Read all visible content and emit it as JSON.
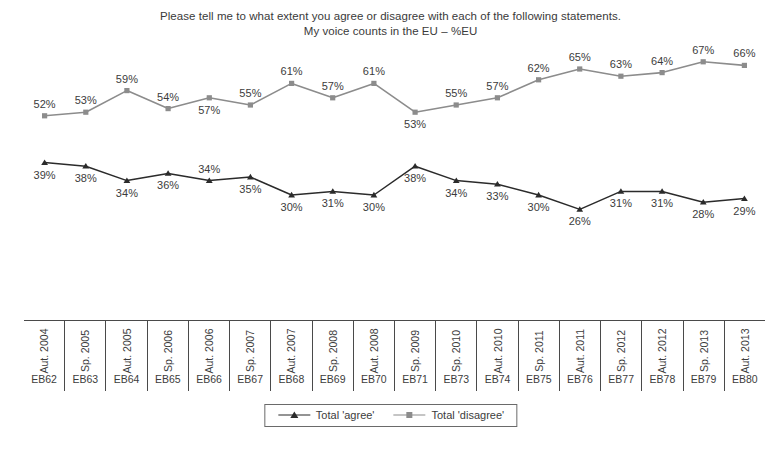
{
  "chart_data": {
    "type": "line",
    "title": "Please tell me to what extent you agree or disagree with each of the following statements.",
    "subtitle": "My voice counts in the EU – %EU",
    "xlabel": "",
    "ylabel": "",
    "ylim": [
      20,
      70
    ],
    "grid": false,
    "legend_position": "bottom-center",
    "categories": [
      "EB62",
      "EB63",
      "EB64",
      "EB65",
      "EB66",
      "EB67",
      "EB68",
      "EB69",
      "EB70",
      "EB71",
      "EB73",
      "EB74",
      "EB75",
      "EB76",
      "EB77",
      "EB78",
      "EB79",
      "EB80"
    ],
    "waves": [
      "Aut. 2004",
      "Sp. 2005",
      "Aut. 2005",
      "Sp. 2006",
      "Aut. 2006",
      "Sp. 2007",
      "Aut. 2007",
      "Sp. 2008",
      "Aut. 2008",
      "Sp. 2009",
      "Sp. 2010",
      "Aut. 2010",
      "Sp. 2011",
      "Aut. 2011",
      "Sp. 2012",
      "Aut. 2012",
      "Sp. 2013",
      "Aut. 2013"
    ],
    "series": [
      {
        "name": "Total 'agree'",
        "color": "#2b2b2b",
        "marker": "triangle",
        "values": [
          39,
          38,
          34,
          36,
          34,
          35,
          30,
          31,
          30,
          38,
          34,
          33,
          30,
          26,
          31,
          31,
          28,
          29
        ],
        "labels": [
          "39%",
          "38%",
          "34%",
          "36%",
          "34%",
          "35%",
          "30%",
          "31%",
          "30%",
          "38%",
          "34%",
          "33%",
          "30%",
          "26%",
          "31%",
          "31%",
          "28%",
          "29%"
        ],
        "label_side": [
          "below",
          "below",
          "below",
          "below",
          "above",
          "below",
          "below",
          "below",
          "below",
          "below",
          "below",
          "below",
          "below",
          "below",
          "below",
          "below",
          "below",
          "below"
        ]
      },
      {
        "name": "Total 'disagree'",
        "color": "#8c8c8c",
        "marker": "square",
        "values": [
          52,
          53,
          59,
          54,
          57,
          55,
          61,
          57,
          61,
          53,
          55,
          57,
          62,
          65,
          63,
          64,
          67,
          66
        ],
        "labels": [
          "52%",
          "53%",
          "59%",
          "54%",
          "57%",
          "55%",
          "61%",
          "57%",
          "61%",
          "53%",
          "55%",
          "57%",
          "62%",
          "65%",
          "63%",
          "64%",
          "67%",
          "66%"
        ],
        "label_side": [
          "above",
          "above",
          "above",
          "above",
          "below",
          "above",
          "above",
          "above",
          "above",
          "below",
          "above",
          "above",
          "above",
          "above",
          "above",
          "above",
          "above",
          "above"
        ]
      }
    ]
  },
  "legend": {
    "items": [
      {
        "label": "Total 'agree'",
        "color": "#2b2b2b",
        "marker": "triangle"
      },
      {
        "label": "Total 'disagree'",
        "color": "#8c8c8c",
        "marker": "square"
      }
    ]
  }
}
